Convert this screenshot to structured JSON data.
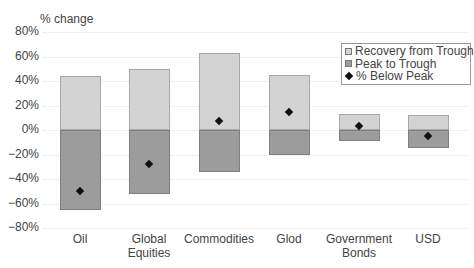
{
  "chart_data": {
    "type": "bar",
    "subtype": "floating-bar-with-markers",
    "title": "",
    "ylabel": "% change",
    "xlabel": "",
    "ylim": [
      -80,
      80
    ],
    "yticks": [
      "80%",
      "60%",
      "40%",
      "20%",
      "0%",
      "−20%",
      "−40%",
      "−60%",
      "−80%"
    ],
    "grid": true,
    "legend_position": "upper right",
    "categories": [
      "Oil",
      "Global Equities",
      "Commodities",
      "Glod",
      "Government Bonds",
      "USD"
    ],
    "category_labels": [
      [
        "Oil"
      ],
      [
        "Global",
        "Equities"
      ],
      [
        "Commodities"
      ],
      [
        "Glod"
      ],
      [
        "Government",
        "Bonds"
      ],
      [
        "USD"
      ]
    ],
    "series": [
      {
        "name": "Recovery from Trough",
        "values": [
          44,
          50,
          63,
          45,
          13,
          12
        ],
        "color": "#d3d3d3"
      },
      {
        "name": "Peak to Trough",
        "values": [
          -65,
          -52,
          -34,
          -20,
          -9,
          -15
        ],
        "color": "#9c9c9c"
      },
      {
        "name": "% Below Peak",
        "values": [
          -50,
          -28,
          7,
          15,
          3,
          -5
        ],
        "marker": "diamond",
        "color": "#111111"
      }
    ]
  },
  "legend": {
    "items": [
      "Recovery from Trough",
      "Peak to Trough",
      "% Below Peak"
    ]
  }
}
